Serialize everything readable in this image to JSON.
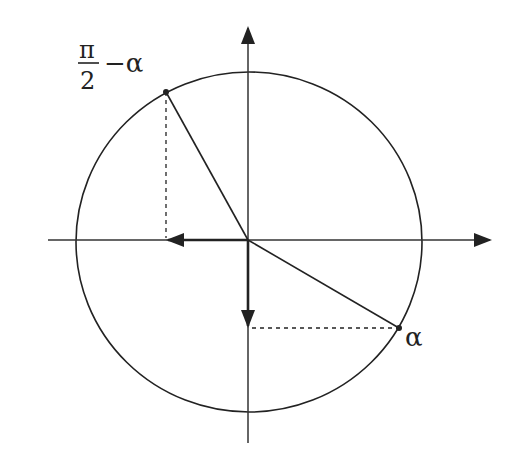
{
  "diagram": {
    "type": "unit-circle",
    "labels": {
      "alpha": "α",
      "complement_numerator": "π",
      "complement_denominator": "2",
      "complement_suffix": "−α"
    },
    "colors": {
      "stroke": "#222222",
      "background": "#ffffff"
    },
    "points": {
      "alpha": {
        "x": 399,
        "y": 328
      },
      "complement": {
        "x": 166,
        "y": 92
      }
    },
    "origin": {
      "x": 248,
      "y": 240
    }
  }
}
